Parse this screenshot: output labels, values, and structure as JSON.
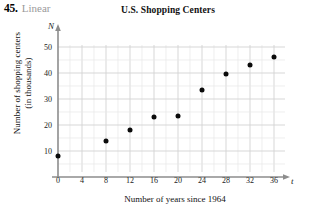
{
  "problem": {
    "number": "45.",
    "kind": "Linear"
  },
  "chart_data": {
    "type": "scatter",
    "title": "U.S. Shopping Centers",
    "xlabel": "Number of years since 1964",
    "ylabel": "Number of shopping centers (in thousands)",
    "ylabel_line1": "Number of shopping centers",
    "ylabel_line2": "(in thousands)",
    "x_var": "t",
    "y_var": "N",
    "x": [
      0,
      8,
      12,
      16,
      20,
      24,
      28,
      32,
      36
    ],
    "values": [
      8,
      14,
      18,
      23,
      23.5,
      33.5,
      39.5,
      43,
      46
    ],
    "points": [
      {
        "t": 0,
        "N": 8
      },
      {
        "t": 8,
        "N": 14
      },
      {
        "t": 12,
        "N": 18
      },
      {
        "t": 16,
        "N": 23
      },
      {
        "t": 20,
        "N": 23.5
      },
      {
        "t": 24,
        "N": 33.5
      },
      {
        "t": 28,
        "N": 39.5
      },
      {
        "t": 32,
        "N": 43
      },
      {
        "t": 36,
        "N": 46
      }
    ],
    "xticks": [
      0,
      4,
      8,
      12,
      16,
      20,
      24,
      28,
      32,
      36
    ],
    "yticks": [
      10,
      20,
      30,
      40,
      50
    ],
    "xlim": [
      0,
      38
    ],
    "ylim": [
      0,
      52
    ],
    "grid": true,
    "grid_color": "#dcdcdc",
    "point_color": "#0b0b0b",
    "axis_color": "#8a8a8a",
    "legend": null
  }
}
